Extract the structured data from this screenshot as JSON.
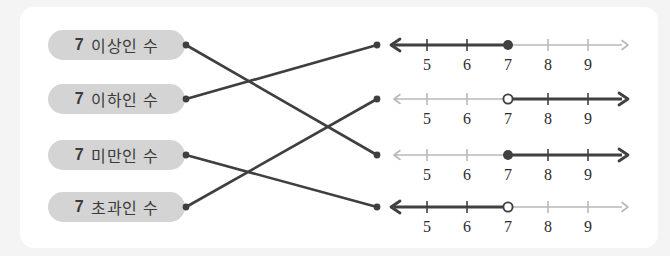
{
  "card": {
    "background": "#ffffff",
    "page_background": "#f4f4f4"
  },
  "colors": {
    "pill_background": "#d4d4d4",
    "pill_text": "#3b3b3b",
    "line_dark": "#404040",
    "line_light": "#b9b9b9",
    "connector": "#3f3f3f"
  },
  "labels": [
    {
      "number": "7",
      "text": "이상인 수",
      "name": "label-isang"
    },
    {
      "number": "7",
      "text": "이하인 수",
      "name": "label-iha"
    },
    {
      "number": "7",
      "text": "미만인 수",
      "name": "label-miman"
    },
    {
      "number": "7",
      "text": "초과인 수",
      "name": "label-chogwa"
    }
  ],
  "numberlines": [
    {
      "ticks": [
        "5",
        "6",
        "7",
        "8",
        "9"
      ],
      "marker_value": "7",
      "marker_type": "closed",
      "shaded_direction": "left",
      "represents": "7 이하인 수"
    },
    {
      "ticks": [
        "5",
        "6",
        "7",
        "8",
        "9"
      ],
      "marker_value": "7",
      "marker_type": "open",
      "shaded_direction": "right",
      "represents": "7 초과인 수"
    },
    {
      "ticks": [
        "5",
        "6",
        "7",
        "8",
        "9"
      ],
      "marker_value": "7",
      "marker_type": "closed",
      "shaded_direction": "right",
      "represents": "7 이상인 수"
    },
    {
      "ticks": [
        "5",
        "6",
        "7",
        "8",
        "9"
      ],
      "marker_value": "7",
      "marker_type": "open",
      "shaded_direction": "left",
      "represents": "7 미만인 수"
    }
  ],
  "connections": [
    {
      "from_label": 0,
      "to_line": 2
    },
    {
      "from_label": 1,
      "to_line": 0
    },
    {
      "from_label": 2,
      "to_line": 3
    },
    {
      "from_label": 3,
      "to_line": 1
    }
  ]
}
